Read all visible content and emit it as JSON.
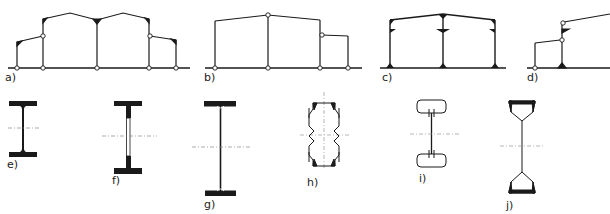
{
  "figure": {
    "frames": [
      {
        "id": "a",
        "label": "a)",
        "description": "Three-bay frame with raised center bays and low side lean-tos, hinged connections"
      },
      {
        "id": "b",
        "label": "b)",
        "description": "Two-bay pitched frame with side lean-to, pinned joints"
      },
      {
        "id": "c",
        "label": "c)",
        "description": "Two-bay pitched frame with rigid haunched connections and fixed bases"
      },
      {
        "id": "d",
        "label": "d)",
        "description": "Partial frame with lean-to and rigid column base"
      }
    ],
    "sections": [
      {
        "id": "e",
        "label": "e)",
        "description": "Rolled I-section"
      },
      {
        "id": "f",
        "label": "f)",
        "description": "Welded I-section with thin web insert"
      },
      {
        "id": "g",
        "label": "g)",
        "description": "Tall welded plate girder"
      },
      {
        "id": "h",
        "label": "h)",
        "description": "Cold-formed corrugated-web section"
      },
      {
        "id": "i",
        "label": "i)",
        "description": "Section with rounded hollow flanges"
      },
      {
        "id": "j",
        "label": "j)",
        "description": "Section with trapezoidal hollow flanges"
      }
    ]
  },
  "colors": {
    "line": "#1a1a1a",
    "axis": "#888888",
    "background": "#ffffff"
  }
}
